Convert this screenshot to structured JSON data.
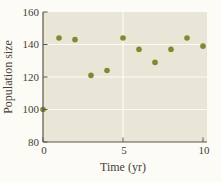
{
  "chart_data": {
    "type": "scatter",
    "title": "",
    "xlabel": "Time (yr)",
    "ylabel": "Population size",
    "x": [
      0,
      1,
      2,
      3,
      4,
      5,
      6,
      7,
      8,
      9,
      10
    ],
    "y": [
      100,
      144,
      143,
      121,
      124,
      144,
      137,
      129,
      137,
      144,
      139
    ],
    "xlim": [
      0,
      10
    ],
    "ylim": [
      80,
      160
    ],
    "x_ticks": [
      "0",
      "5",
      "10"
    ],
    "x_tick_values": [
      0,
      5,
      10
    ],
    "y_ticks": [
      "80",
      "100",
      "120",
      "140",
      "160"
    ],
    "y_tick_values": [
      80,
      100,
      120,
      140,
      160
    ],
    "grid": true,
    "gridline_y_values": [
      100,
      120,
      140
    ],
    "gridline_x_values": [
      5
    ],
    "legend": "none"
  },
  "colors": {
    "page_bg": "#fcfbf6",
    "plot_bg": "#e9e6d8",
    "grid": "#fdfcf4",
    "point": "#7d8c33",
    "axis": "#5d564c",
    "text": "#453f37"
  }
}
